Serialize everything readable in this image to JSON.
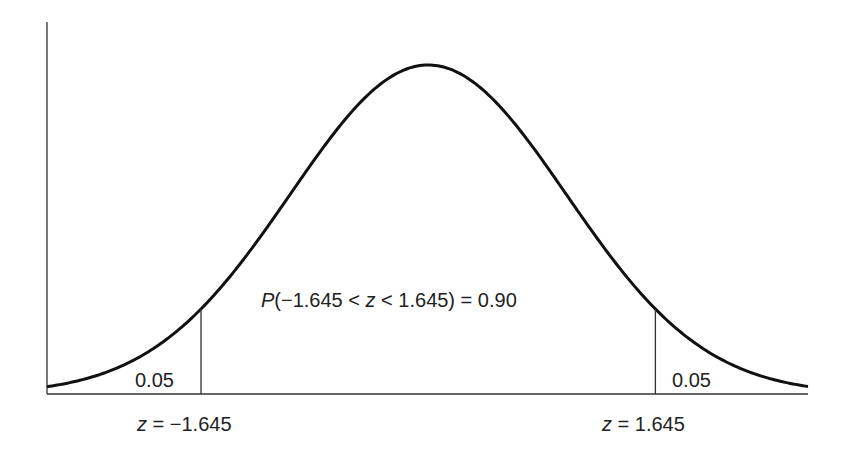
{
  "figure": {
    "distribution": "standard normal",
    "z_range": [
      -2.76,
      2.75
    ],
    "critical_values": [
      -1.645,
      1.645
    ],
    "colors": {
      "curve": "#111111",
      "axis": "#333333",
      "text": "#222222"
    },
    "left_tail": {
      "area_label": "0.05",
      "z_label": {
        "var": "z",
        "eq": " = ",
        "value": "−1.645"
      }
    },
    "right_tail": {
      "area_label": "0.05",
      "z_label": {
        "var": "z",
        "eq": " = ",
        "value": "1.645"
      }
    },
    "center_annotation": {
      "p": "P",
      "open": "(−1.645 < ",
      "var": "z",
      "close": " < 1.645) = 0.90"
    }
  },
  "chart_data": {
    "type": "line",
    "title": "",
    "xlabel": "z",
    "ylabel": "",
    "series": [
      {
        "name": "Standard normal density",
        "function": "exp(-z^2/2)/sqrt(2*pi)"
      }
    ],
    "xlim": [
      -2.76,
      2.75
    ],
    "markers": [
      {
        "z": -1.645,
        "label": "z = −1.645",
        "tail_area": 0.05
      },
      {
        "z": 1.645,
        "label": "z = 1.645",
        "tail_area": 0.05
      }
    ],
    "annotations": [
      "P(−1.645 < z < 1.645) = 0.90",
      "0.05",
      "0.05"
    ],
    "grid": false,
    "legend": "none"
  }
}
